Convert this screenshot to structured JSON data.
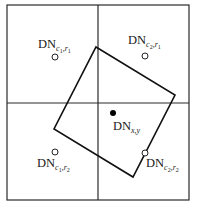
{
  "diagram": {
    "type": "pixel-resampling-geometry",
    "colors": {
      "lines": "#2a2a2a",
      "footprint": "#111111",
      "background": "#ffffff",
      "target_point": "#000000"
    },
    "grid": {
      "outer": {
        "x": 7,
        "y": 5,
        "width": 182,
        "height": 195
      },
      "vertical_divider_x": 98,
      "horizontal_divider_y": 103
    },
    "footprint_polygon": {
      "points": "96,47 175,95 133,177 54,129"
    },
    "pixels": [
      {
        "id": "c1r1",
        "base": "DN",
        "sub_a": "c",
        "sub_a_idx": "1",
        "sep": ",",
        "sub_b": "r",
        "sub_b_idx": "1",
        "circle": {
          "cx": 55,
          "cy": 57
        },
        "label_pos": {
          "x": 38,
          "y": 48
        }
      },
      {
        "id": "c2r1",
        "base": "DN",
        "sub_a": "c",
        "sub_a_idx": "2",
        "sep": ",",
        "sub_b": "r",
        "sub_b_idx": "1",
        "circle": {
          "cx": 145,
          "cy": 56
        },
        "label_pos": {
          "x": 128,
          "y": 44
        }
      },
      {
        "id": "c1r2",
        "base": "DN",
        "sub_a": "c",
        "sub_a_idx": "1",
        "sep": ",",
        "sub_b": "r",
        "sub_b_idx": "2",
        "circle": {
          "cx": 55,
          "cy": 152
        },
        "label_pos": {
          "x": 37,
          "y": 167
        }
      },
      {
        "id": "c2r2",
        "base": "DN",
        "sub_a": "c",
        "sub_a_idx": "2",
        "sep": ",",
        "sub_b": "r",
        "sub_b_idx": "2",
        "circle": {
          "cx": 145,
          "cy": 153
        },
        "label_pos": {
          "x": 146,
          "y": 167
        }
      }
    ],
    "target": {
      "base": "DN",
      "sub": "x,y",
      "dot": {
        "cx": 113,
        "cy": 113,
        "r": 3
      },
      "label_pos": {
        "x": 113,
        "y": 130
      }
    }
  }
}
